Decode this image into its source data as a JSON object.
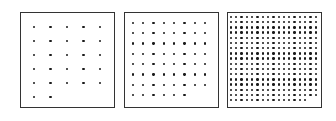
{
  "figure": {
    "panels": [
      {
        "id": "sparse",
        "box": [
          20,
          12,
          95,
          96
        ],
        "cols": 5,
        "rows": 6,
        "last_row_count": 2,
        "dot_size": 2.6,
        "start": [
          34,
          27
        ],
        "step": [
          16.5,
          14
        ]
      },
      {
        "id": "medium",
        "box": [
          124,
          12,
          95,
          96
        ],
        "cols": 8,
        "rows": 8,
        "last_row_count": 6,
        "dot_size": 2.3,
        "start": [
          133,
          23
        ],
        "step": [
          10.3,
          10.3
        ]
      },
      {
        "id": "dense",
        "box": [
          227,
          12,
          95,
          96
        ],
        "cols": 17,
        "rows": 17,
        "last_row_count": 15,
        "dot_size": 2.4,
        "start": [
          231,
          17
        ],
        "step": [
          5.3,
          5.2
        ]
      }
    ]
  }
}
